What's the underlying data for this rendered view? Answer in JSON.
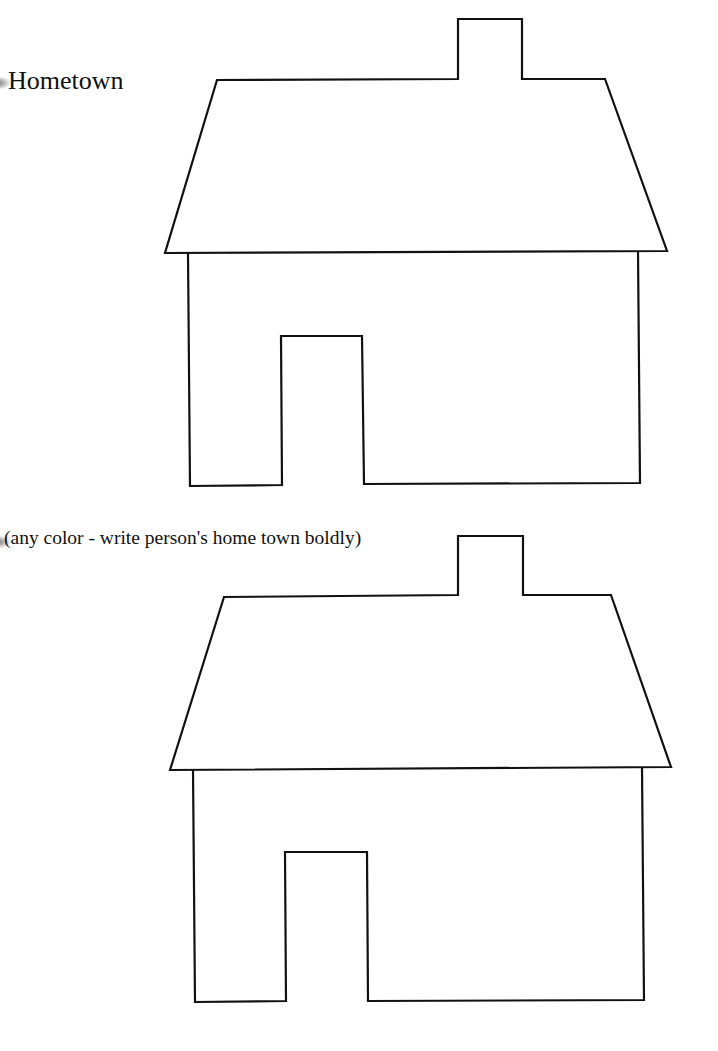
{
  "document": {
    "title": "Hometown",
    "instruction": "(any color - write person's home town boldly)",
    "stroke_color": "#111111",
    "background_color": "#ffffff"
  },
  "shapes": [
    {
      "name": "house-template-1",
      "roof_points": "217,80 458,79 458,19 522,19 522,79 605,79 667,251 165,253",
      "body_points": "188,253 190,486 282,485 281,336 362,336 364,484 640,483 638,251"
    },
    {
      "name": "house-template-2",
      "roof_points": "224,597 458,595 458,536 523,536 523,595 611,595 671,767 170,770",
      "body_points": "193,770 195,1002 286,1001 285,852 367,852 368,1001 644,1000 642,767"
    }
  ]
}
